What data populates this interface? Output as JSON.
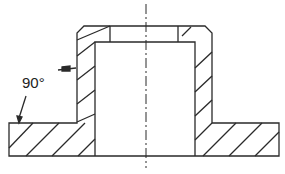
{
  "drawing": {
    "type": "section view of flanged bushing",
    "annotations": [
      {
        "text": "90°",
        "meaning": "countersink/chamfer angle"
      }
    ],
    "line_color": "#2a2a2a",
    "background": "#ffffff"
  }
}
